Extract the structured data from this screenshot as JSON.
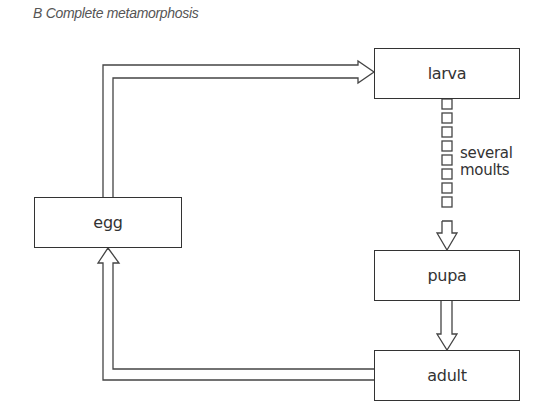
{
  "title": "B Complete metamorphosis",
  "nodes": {
    "egg": {
      "label": "egg"
    },
    "larva": {
      "label": "larva"
    },
    "pupa": {
      "label": "pupa"
    },
    "adult": {
      "label": "adult"
    }
  },
  "edges": [
    {
      "from": "egg",
      "to": "larva",
      "style": "hollow-arrow"
    },
    {
      "from": "larva",
      "to": "pupa",
      "style": "segmented-hollow-arrow",
      "label_line1": "several",
      "label_line2": "moults"
    },
    {
      "from": "pupa",
      "to": "adult",
      "style": "hollow-arrow"
    },
    {
      "from": "adult",
      "to": "egg",
      "style": "hollow-arrow"
    }
  ],
  "colors": {
    "stroke": "#333333",
    "title": "#555555",
    "background": "#ffffff"
  }
}
